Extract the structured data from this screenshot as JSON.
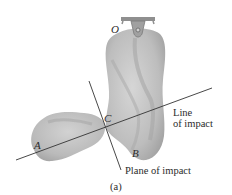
{
  "figure": {
    "caption": "(a)",
    "points": {
      "O": "O",
      "A": "A",
      "B": "B",
      "C": "C"
    },
    "labels": {
      "line_of_impact_1": "Line",
      "line_of_impact_2": "of impact",
      "plane_of_impact": "Plane of impact"
    },
    "colors": {
      "body_fill": "#b9b9b9",
      "body_shade": "#9a9a9a",
      "line": "#333333",
      "support": "#8a8a8a"
    }
  }
}
